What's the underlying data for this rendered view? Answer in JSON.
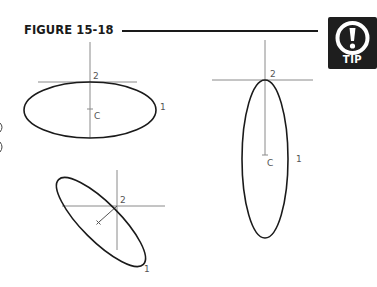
{
  "figure": {
    "title": "FIGURE 15-18",
    "tip_badge": {
      "icon": "exclamation-circle-icon",
      "label": "TIP"
    }
  },
  "drawings": {
    "horizontal_ellipse": {
      "point_2_label": "2",
      "center_label": "C",
      "point_1_label": "1"
    },
    "vertical_ellipse": {
      "point_2_label": "2",
      "center_label": "C",
      "point_1_label": "1"
    },
    "rotated_ellipse": {
      "point_2_label": "2",
      "point_1_label": "1"
    }
  },
  "colors": {
    "ink": "#1a1a1a",
    "construction_line": "#8a8a8a",
    "tip_background": "#1e1e1e"
  }
}
